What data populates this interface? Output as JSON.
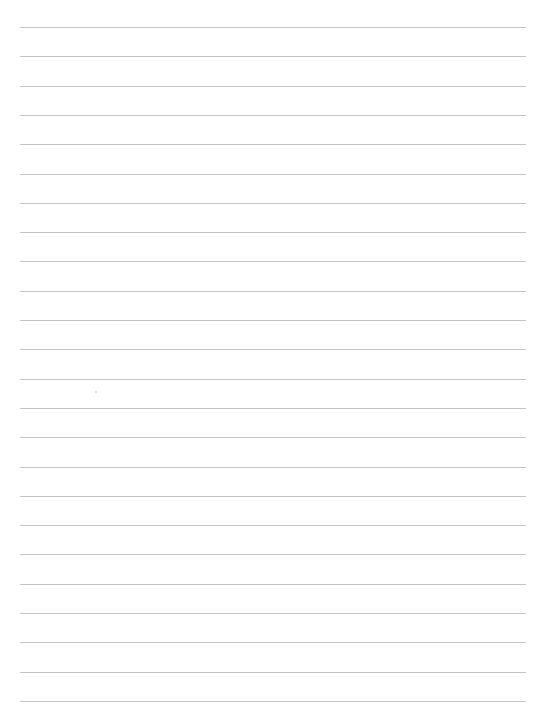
{
  "page": {
    "type": "blank lined paper",
    "background": "#ffffff",
    "rule_color": "#c4c4c4",
    "rule_count": 24,
    "rule_start_y": 27,
    "rule_spacing": 29.3,
    "rule_left": 20,
    "rule_width": 506
  }
}
